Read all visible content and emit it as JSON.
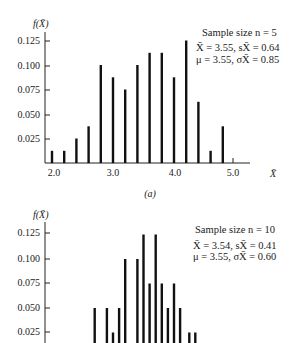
{
  "chart_data": [
    {
      "type": "bar",
      "panel_label": "(a)",
      "ylabel": "f(X̄)",
      "xlabel": "X̄",
      "yticks": [
        "0.125",
        "0.100",
        "0.075",
        "0.050",
        "0.025"
      ],
      "xticks": [
        "2.0",
        "3.0",
        "4.0",
        "5.0"
      ],
      "ylim": [
        0,
        0.13
      ],
      "xlim": [
        1.9,
        5.6
      ],
      "grid": false,
      "annotations": [
        "Sample size n = 5",
        "X̄ = 3.55, sX̄ = 0.64",
        "μ = 3.55, σX̄ = 0.85"
      ],
      "x": [
        2.0,
        2.2,
        2.4,
        2.6,
        2.8,
        3.0,
        3.2,
        3.4,
        3.6,
        3.8,
        4.0,
        4.2,
        4.4,
        4.6,
        4.8
      ],
      "values": [
        0.0125,
        0.0125,
        0.025,
        0.0375,
        0.1,
        0.0875,
        0.075,
        0.1,
        0.1125,
        0.1125,
        0.0875,
        0.125,
        0.0625,
        0.0125,
        0.0375
      ]
    },
    {
      "type": "bar",
      "ylabel": "f(X̄)",
      "yticks": [
        "0.125",
        "0.100",
        "0.075",
        "0.050",
        "0.025"
      ],
      "ylim": [
        0,
        0.13
      ],
      "grid": false,
      "annotations": [
        "Sample size n = 10",
        "X̄ = 3.54, sX̄ = 0.41",
        "μ = 3.55, σX̄ = 0.60"
      ],
      "x": [
        2.7,
        2.9,
        3.0,
        3.1,
        3.2,
        3.4,
        3.5,
        3.6,
        3.7,
        3.8,
        3.9,
        4.0,
        4.1,
        4.25,
        4.35
      ],
      "values": [
        0.05,
        0.05,
        0.025,
        0.05,
        0.1,
        0.1,
        0.125,
        0.075,
        0.125,
        0.075,
        0.05,
        0.075,
        0.05,
        0.025,
        0.025
      ]
    }
  ],
  "chart1": {
    "ylabel": "f(X̄)",
    "panel_label": "(a)",
    "annotation_line1": "Sample size n = 5",
    "annotation_line2": "X̄ = 3.55, sX̄ = 0.64",
    "annotation_line3": "μ = 3.55, σX̄ = 0.85",
    "xtick_2": "2.0",
    "xtick_3": "3.0",
    "xtick_4": "4.0",
    "xtick_5": "5.0",
    "xlabel": "X̄"
  },
  "chart2": {
    "ylabel": "f(X̄)",
    "annotation_line1": "Sample size n = 10",
    "annotation_line2": "X̄ = 3.54, sX̄ = 0.41",
    "annotation_line3": "μ = 3.55, σX̄ = 0.60"
  },
  "yticks": {
    "t125": "0.125",
    "t100": "0.100",
    "t075": "0.075",
    "t050": "0.050",
    "t025": "0.025"
  }
}
